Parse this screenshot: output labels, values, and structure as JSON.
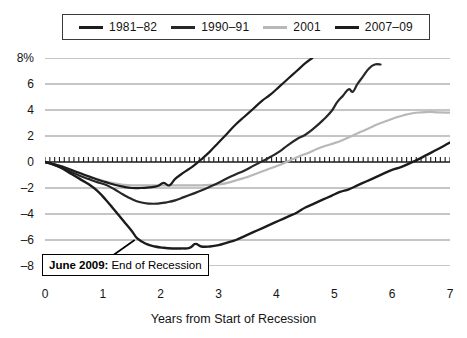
{
  "chart_data": {
    "type": "line",
    "title": "",
    "xlabel": "Years from Start of Recession",
    "ylabel": "",
    "xlim": [
      0,
      7
    ],
    "ylim": [
      -8,
      8
    ],
    "grid": true,
    "legend_position": "top",
    "x_ticks": [
      "0",
      "1",
      "2",
      "3",
      "4",
      "5",
      "6",
      "7"
    ],
    "y_ticks": [
      "8%",
      "6",
      "4",
      "2",
      "0",
      "-2",
      "-4",
      "-6",
      "-8"
    ],
    "zero_line_style": "hatched-tick-axis",
    "annotations": [
      {
        "bold_text": "June 2009:",
        "text": "End of Recession",
        "points_to_series": "2007-09",
        "point_x": 1.55,
        "point_y": -6.0
      }
    ],
    "series": [
      {
        "name": "1981-82",
        "color": "#1c1c1c",
        "width": 2.2,
        "points": [
          [
            0.0,
            0.0
          ],
          [
            0.15,
            -0.15
          ],
          [
            0.3,
            -0.35
          ],
          [
            0.45,
            -0.6
          ],
          [
            0.6,
            -0.85
          ],
          [
            0.75,
            -1.1
          ],
          [
            0.9,
            -1.35
          ],
          [
            1.05,
            -1.55
          ],
          [
            1.2,
            -1.75
          ],
          [
            1.35,
            -1.9
          ],
          [
            1.5,
            -2.0
          ],
          [
            1.65,
            -2.0
          ],
          [
            1.8,
            -1.95
          ],
          [
            1.95,
            -1.85
          ],
          [
            2.05,
            -1.6
          ],
          [
            2.15,
            -1.8
          ],
          [
            2.25,
            -1.3
          ],
          [
            2.4,
            -0.8
          ],
          [
            2.55,
            -0.35
          ],
          [
            2.7,
            0.2
          ],
          [
            2.85,
            0.8
          ],
          [
            3.0,
            1.5
          ],
          [
            3.15,
            2.2
          ],
          [
            3.3,
            2.9
          ],
          [
            3.45,
            3.5
          ],
          [
            3.6,
            4.1
          ],
          [
            3.75,
            4.7
          ],
          [
            3.9,
            5.2
          ],
          [
            4.05,
            5.8
          ],
          [
            4.2,
            6.4
          ],
          [
            4.35,
            7.0
          ],
          [
            4.5,
            7.6
          ],
          [
            4.62,
            8.0
          ]
        ]
      },
      {
        "name": "1990-91",
        "color": "#272727",
        "width": 2.2,
        "points": [
          [
            0.0,
            0.0
          ],
          [
            0.15,
            -0.2
          ],
          [
            0.3,
            -0.45
          ],
          [
            0.45,
            -0.75
          ],
          [
            0.6,
            -1.05
          ],
          [
            0.75,
            -1.3
          ],
          [
            0.9,
            -1.55
          ],
          [
            1.05,
            -1.75
          ],
          [
            1.2,
            -2.1
          ],
          [
            1.35,
            -2.5
          ],
          [
            1.5,
            -2.85
          ],
          [
            1.65,
            -3.1
          ],
          [
            1.8,
            -3.2
          ],
          [
            1.95,
            -3.2
          ],
          [
            2.1,
            -3.1
          ],
          [
            2.25,
            -2.95
          ],
          [
            2.4,
            -2.7
          ],
          [
            2.55,
            -2.45
          ],
          [
            2.7,
            -2.2
          ],
          [
            2.85,
            -1.9
          ],
          [
            3.0,
            -1.6
          ],
          [
            3.15,
            -1.25
          ],
          [
            3.3,
            -0.95
          ],
          [
            3.45,
            -0.65
          ],
          [
            3.6,
            -0.3
          ],
          [
            3.75,
            0.05
          ],
          [
            3.9,
            0.4
          ],
          [
            4.05,
            0.8
          ],
          [
            4.2,
            1.3
          ],
          [
            4.35,
            1.75
          ],
          [
            4.5,
            2.1
          ],
          [
            4.65,
            2.6
          ],
          [
            4.8,
            3.2
          ],
          [
            4.95,
            3.9
          ],
          [
            5.05,
            4.6
          ],
          [
            5.15,
            5.1
          ],
          [
            5.25,
            5.6
          ],
          [
            5.32,
            5.4
          ],
          [
            5.4,
            6.0
          ],
          [
            5.5,
            6.6
          ],
          [
            5.6,
            7.2
          ],
          [
            5.7,
            7.5
          ],
          [
            5.8,
            7.5
          ]
        ]
      },
      {
        "name": "2001",
        "color": "#b8b8b8",
        "width": 2.2,
        "points": [
          [
            0.0,
            0.0
          ],
          [
            0.15,
            -0.15
          ],
          [
            0.3,
            -0.35
          ],
          [
            0.45,
            -0.6
          ],
          [
            0.6,
            -0.85
          ],
          [
            0.75,
            -1.1
          ],
          [
            0.9,
            -1.3
          ],
          [
            1.05,
            -1.5
          ],
          [
            1.2,
            -1.65
          ],
          [
            1.35,
            -1.75
          ],
          [
            1.5,
            -1.8
          ],
          [
            1.7,
            -1.8
          ],
          [
            1.9,
            -1.8
          ],
          [
            2.1,
            -1.8
          ],
          [
            2.3,
            -1.8
          ],
          [
            2.5,
            -1.8
          ],
          [
            2.7,
            -1.8
          ],
          [
            2.9,
            -1.75
          ],
          [
            3.05,
            -1.7
          ],
          [
            3.2,
            -1.55
          ],
          [
            3.35,
            -1.35
          ],
          [
            3.5,
            -1.15
          ],
          [
            3.65,
            -0.9
          ],
          [
            3.8,
            -0.65
          ],
          [
            3.95,
            -0.4
          ],
          [
            4.1,
            -0.15
          ],
          [
            4.25,
            0.15
          ],
          [
            4.4,
            0.45
          ],
          [
            4.55,
            0.7
          ],
          [
            4.7,
            1.0
          ],
          [
            4.85,
            1.25
          ],
          [
            5.0,
            1.45
          ],
          [
            5.15,
            1.7
          ],
          [
            5.3,
            2.0
          ],
          [
            5.45,
            2.3
          ],
          [
            5.6,
            2.6
          ],
          [
            5.75,
            2.9
          ],
          [
            5.9,
            3.15
          ],
          [
            6.05,
            3.4
          ],
          [
            6.2,
            3.6
          ],
          [
            6.35,
            3.75
          ],
          [
            6.5,
            3.82
          ],
          [
            6.65,
            3.85
          ],
          [
            6.8,
            3.82
          ],
          [
            7.0,
            3.8
          ]
        ]
      },
      {
        "name": "2007-09",
        "color": "#1c1c1c",
        "width": 2.4,
        "points": [
          [
            0.0,
            0.0
          ],
          [
            0.15,
            -0.2
          ],
          [
            0.3,
            -0.5
          ],
          [
            0.45,
            -0.9
          ],
          [
            0.6,
            -1.3
          ],
          [
            0.75,
            -1.7
          ],
          [
            0.9,
            -2.2
          ],
          [
            1.05,
            -2.9
          ],
          [
            1.2,
            -3.7
          ],
          [
            1.35,
            -4.5
          ],
          [
            1.5,
            -5.3
          ],
          [
            1.6,
            -5.9
          ],
          [
            1.75,
            -6.3
          ],
          [
            1.9,
            -6.5
          ],
          [
            2.05,
            -6.6
          ],
          [
            2.2,
            -6.65
          ],
          [
            2.35,
            -6.65
          ],
          [
            2.5,
            -6.6
          ],
          [
            2.6,
            -6.3
          ],
          [
            2.7,
            -6.5
          ],
          [
            2.85,
            -6.5
          ],
          [
            3.0,
            -6.4
          ],
          [
            3.15,
            -6.2
          ],
          [
            3.3,
            -6.0
          ],
          [
            3.45,
            -5.7
          ],
          [
            3.6,
            -5.4
          ],
          [
            3.75,
            -5.1
          ],
          [
            3.9,
            -4.8
          ],
          [
            4.05,
            -4.5
          ],
          [
            4.2,
            -4.2
          ],
          [
            4.35,
            -3.9
          ],
          [
            4.5,
            -3.5
          ],
          [
            4.65,
            -3.2
          ],
          [
            4.8,
            -2.9
          ],
          [
            4.95,
            -2.6
          ],
          [
            5.1,
            -2.3
          ],
          [
            5.25,
            -2.1
          ],
          [
            5.4,
            -1.8
          ],
          [
            5.55,
            -1.5
          ],
          [
            5.7,
            -1.2
          ],
          [
            5.85,
            -0.9
          ],
          [
            6.0,
            -0.6
          ],
          [
            6.15,
            -0.4
          ],
          [
            6.3,
            -0.1
          ],
          [
            6.45,
            0.2
          ],
          [
            6.6,
            0.55
          ],
          [
            6.75,
            0.9
          ],
          [
            6.9,
            1.25
          ],
          [
            7.0,
            1.5
          ]
        ]
      }
    ]
  },
  "legend": {
    "entries": [
      {
        "label": "1981–82",
        "color": "#1c1c1c"
      },
      {
        "label": "1990–91",
        "color": "#272727"
      },
      {
        "label": "2001",
        "color": "#b8b8b8"
      },
      {
        "label": "2007–09",
        "color": "#1c1c1c"
      }
    ]
  },
  "axes": {
    "y_labels": [
      "8%",
      "6",
      "4",
      "2",
      "0",
      "–2",
      "–4",
      "–6",
      "–8"
    ],
    "x_labels": [
      "0",
      "1",
      "2",
      "3",
      "4",
      "5",
      "6",
      "7"
    ],
    "x_title": "Years from Start of Recession"
  },
  "annotation": {
    "bold": "June 2009:",
    "text": "End of Recession"
  },
  "colors": {
    "background": "#ffffff",
    "gridline": "#8c8c8c",
    "axis": "#1a1a1a",
    "text": "#141414"
  }
}
